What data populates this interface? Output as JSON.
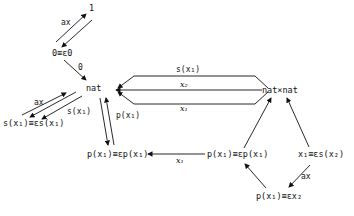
{
  "diagram": {
    "nodes": {
      "one": "1",
      "zero_eq": "0≡ε0",
      "nat": "nat",
      "natxnat": "nat×nat",
      "s_eq": "s(x₁)≡εs(x₁)",
      "p_eq_left": "p(x₁)≡εp(x₁)",
      "p_eq_right": "p(x₁)≡εp(x₁)",
      "x1_eq_s": "x₁≡εs(x₂)",
      "p_eq_x2": "p(x₁)≡εx₂"
    },
    "edge_labels": {
      "ax_top": "ax",
      "zero": "0",
      "ax_left": "ax",
      "s_left": "s(x₁)",
      "p_left": "p(x₁)",
      "s_top": "s(x₁)",
      "x2_mid": "x₂",
      "x1_bottom": "x₁",
      "x1_lower": "x₁",
      "ax_bottom": "ax"
    }
  }
}
